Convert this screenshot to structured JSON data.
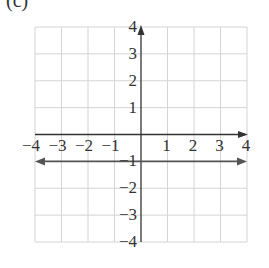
{
  "part_label": "(c)",
  "chart_data": {
    "type": "line",
    "title": "",
    "xlabel": "",
    "ylabel": "",
    "xlim": [
      -4,
      4
    ],
    "ylim": [
      -4,
      4
    ],
    "grid": true,
    "x_ticks": [
      -4,
      -3,
      -2,
      -1,
      1,
      2,
      3,
      4
    ],
    "y_ticks": [
      4,
      3,
      2,
      1,
      -1,
      -2,
      -3,
      -4
    ],
    "x_tick_labels": [
      "−4",
      "−3",
      "−2",
      "−1",
      "1",
      "2",
      "3",
      "4"
    ],
    "y_tick_labels": [
      "4",
      "3",
      "2",
      "1",
      "−1",
      "−2",
      "−3",
      "−4"
    ],
    "series": [
      {
        "name": "y = -1",
        "x": [
          -4,
          4
        ],
        "y": [
          -1,
          -1
        ],
        "arrows": "both"
      }
    ]
  },
  "colors": {
    "grid": "#d4d4d4",
    "axis": "#333333",
    "line": "#555555",
    "text": "#333333"
  }
}
